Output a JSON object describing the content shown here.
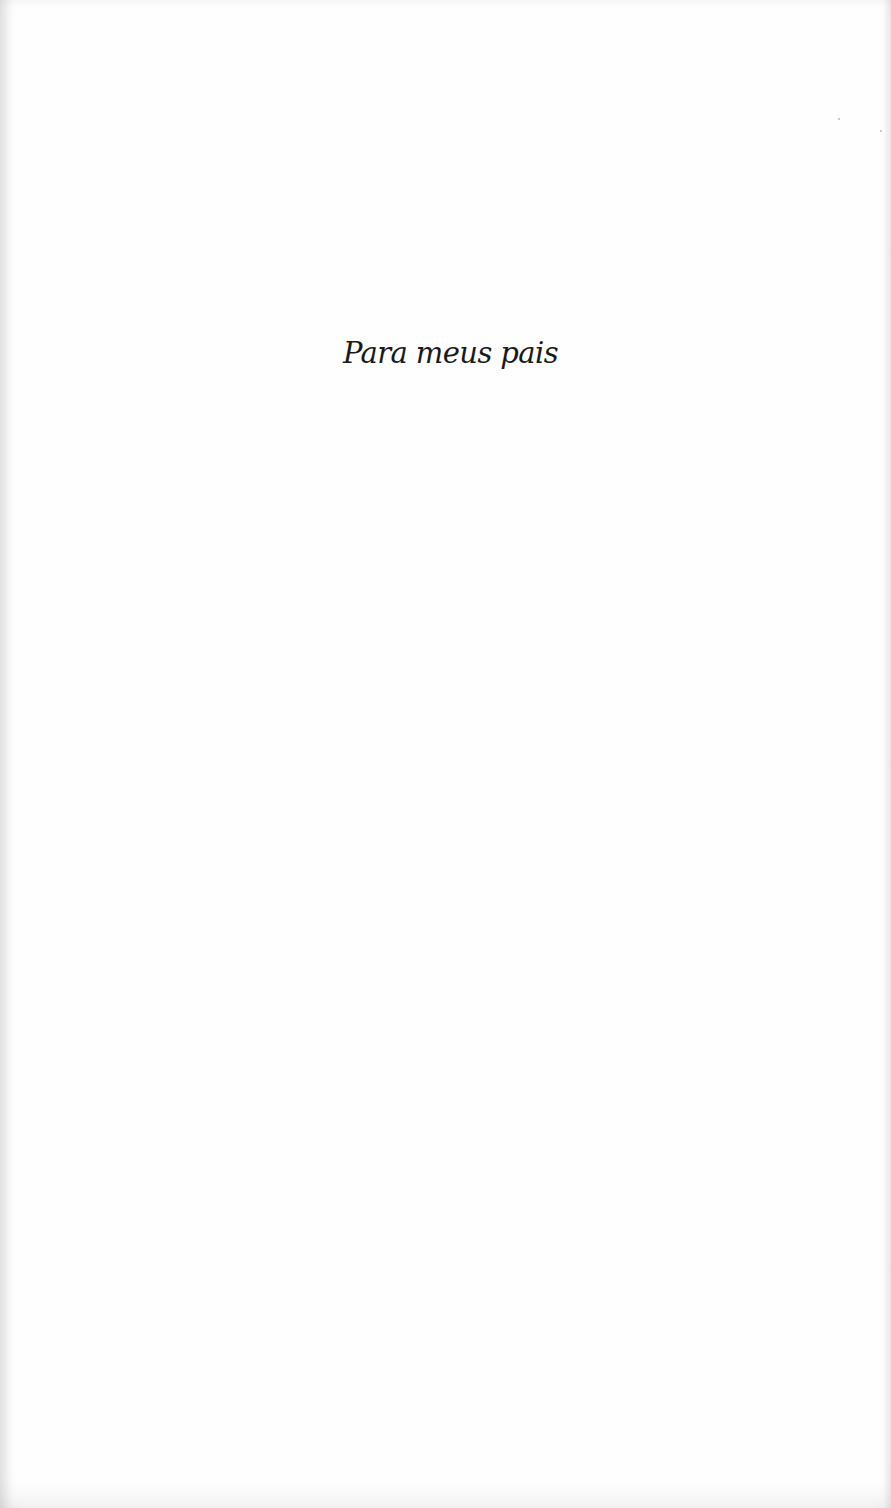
{
  "page": {
    "type": "dedication",
    "background_color": "#fefefe",
    "text_color": "#1a1a1a"
  },
  "dedication": {
    "text": "Para meus pais"
  }
}
